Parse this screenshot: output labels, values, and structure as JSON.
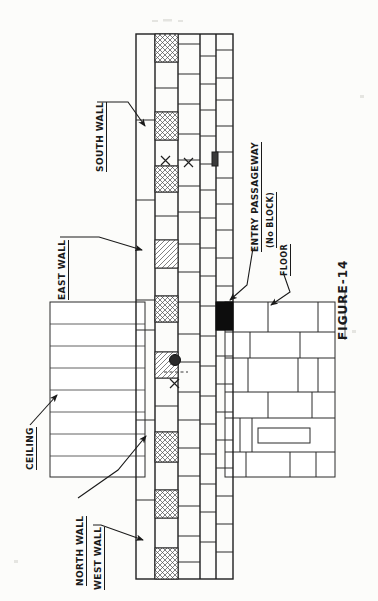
{
  "figure": {
    "id": "FIGURE-14",
    "caption": "FIGURE-14",
    "type": "hand-drawn architectural section / plan of masonry walls",
    "orientation": "drawing rotated 90 degrees on the page"
  },
  "labels": {
    "south_wall": "SOUTH WALL",
    "east_wall": "EAST WALL",
    "north_wall": "NORTH WALL",
    "west_wall": "WEST WALL",
    "ceiling": "CEILING",
    "floor": "FLOOR",
    "entry_passageway": "ENTRY PASSAGEWAY",
    "entry_passageway_note": "(No BLOCK)"
  },
  "marks": {
    "x_mark": "X",
    "x_mark_count": 3,
    "dark_spot": "dark-circle-marker",
    "solid_block": "solid-black-block",
    "solid_block_meaning": "entry passageway opening"
  },
  "legend_semantics": {
    "cross_hatched_block": "cross-hatched masonry block",
    "diagonal_hatched_block": "diagonally hatched masonry block",
    "plain_block": "plain masonry block",
    "black_block": "blocked / solid unit"
  },
  "colors": {
    "ink": "#1f1f1f",
    "line": "#2b2b2b",
    "paper": "#fcfcfa",
    "fill_black": "#0d0d0d",
    "hatch": "#4a4a4a"
  }
}
